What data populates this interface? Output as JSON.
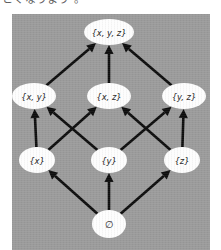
{
  "caption": {
    "text": "とくなうまう 。"
  },
  "figure": {
    "background_color": "#9b9b9b",
    "node_fill_color": "#fdfdfd",
    "edge_color": "#0d0d0d"
  },
  "chart_data": {
    "type": "diagram",
    "title": "",
    "subtitle": "",
    "diagram_kind": "hasse-lattice",
    "ranks": [
      {
        "level": 3,
        "labels": [
          "{x, y, z}"
        ]
      },
      {
        "level": 2,
        "labels": [
          "{x, y}",
          "{x, z}",
          "{y, z}"
        ]
      },
      {
        "level": 1,
        "labels": [
          "{x}",
          "{y}",
          "{z}"
        ]
      },
      {
        "level": 0,
        "labels": [
          "∅"
        ]
      }
    ],
    "nodes": [
      {
        "id": "xyz",
        "label": "{x, y, z}",
        "cx": 97,
        "cy": 18,
        "rx": 25,
        "ry": 13
      },
      {
        "id": "xy",
        "label": "{x, y}",
        "cx": 22,
        "cy": 82,
        "rx": 22,
        "ry": 13
      },
      {
        "id": "xz",
        "label": "{x, z}",
        "cx": 97,
        "cy": 82,
        "rx": 22,
        "ry": 13
      },
      {
        "id": "yz",
        "label": "{y, z}",
        "cx": 172,
        "cy": 82,
        "rx": 22,
        "ry": 13
      },
      {
        "id": "x",
        "label": "{x}",
        "cx": 25,
        "cy": 146,
        "rx": 18,
        "ry": 13
      },
      {
        "id": "y",
        "label": "{y}",
        "cx": 97,
        "cy": 146,
        "rx": 18,
        "ry": 13
      },
      {
        "id": "z",
        "label": "{z}",
        "cx": 170,
        "cy": 146,
        "rx": 18,
        "ry": 13
      },
      {
        "id": "empty",
        "label": "∅",
        "cx": 97,
        "cy": 210,
        "rx": 17,
        "ry": 14
      }
    ],
    "edges": [
      {
        "from": "xy",
        "to": "xyz"
      },
      {
        "from": "xz",
        "to": "xyz"
      },
      {
        "from": "yz",
        "to": "xyz"
      },
      {
        "from": "x",
        "to": "xy"
      },
      {
        "from": "x",
        "to": "xz"
      },
      {
        "from": "y",
        "to": "xy"
      },
      {
        "from": "y",
        "to": "yz"
      },
      {
        "from": "z",
        "to": "xz"
      },
      {
        "from": "z",
        "to": "yz"
      },
      {
        "from": "empty",
        "to": "x"
      },
      {
        "from": "empty",
        "to": "y"
      },
      {
        "from": "empty",
        "to": "z"
      }
    ],
    "edge_direction": "upward",
    "legend": [],
    "xlabel": "",
    "ylabel": ""
  }
}
